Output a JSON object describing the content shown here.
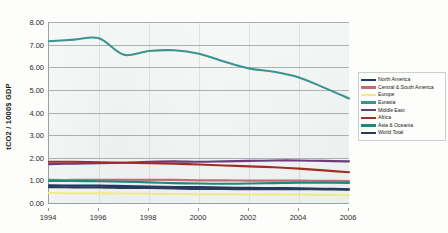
{
  "chart_data": {
    "type": "line",
    "title": "",
    "xlabel": "",
    "ylabel": "tCO2 / 1000$ GDP",
    "xlim": [
      1994,
      2006
    ],
    "ylim": [
      0.0,
      8.0
    ],
    "grid": true,
    "legend_position": "right",
    "y_ticks": [
      "0.00",
      "1.00",
      "2.00",
      "3.00",
      "4.00",
      "5.00",
      "6.00",
      "7.00",
      "8.00"
    ],
    "y_tick_values": [
      0,
      1,
      2,
      3,
      4,
      5,
      6,
      7,
      8
    ],
    "x_ticks": [
      "1994",
      "1996",
      "1998",
      "2000",
      "2002",
      "2004",
      "2006"
    ],
    "x_tick_values": [
      1994,
      1996,
      1998,
      2000,
      2002,
      2004,
      2006
    ],
    "x": [
      1994,
      1995,
      1996,
      1997,
      1998,
      1999,
      2000,
      2001,
      2002,
      2003,
      2004,
      2005,
      2006
    ],
    "series": [
      {
        "name": "North America",
        "color": "#1f3864",
        "values": [
          0.78,
          0.77,
          0.77,
          0.75,
          0.73,
          0.71,
          0.7,
          0.68,
          0.67,
          0.66,
          0.65,
          0.63,
          0.61
        ]
      },
      {
        "name": "Central & South America",
        "color": "#bf6b78",
        "values": [
          1.02,
          1.02,
          1.03,
          1.03,
          1.03,
          1.02,
          1.0,
          1.0,
          0.99,
          0.99,
          0.99,
          0.98,
          0.97
        ]
      },
      {
        "name": "Europe",
        "color": "#f2e98a",
        "values": [
          0.44,
          0.43,
          0.43,
          0.42,
          0.41,
          0.4,
          0.39,
          0.39,
          0.38,
          0.38,
          0.37,
          0.36,
          0.35
        ]
      },
      {
        "name": "Eurasia",
        "color": "#3b9490",
        "values": [
          7.15,
          7.22,
          7.28,
          6.55,
          6.72,
          6.75,
          6.6,
          6.25,
          5.95,
          5.8,
          5.55,
          5.1,
          4.62
        ]
      },
      {
        "name": "Middle East",
        "color": "#6d3a7a",
        "values": [
          1.72,
          1.74,
          1.76,
          1.78,
          1.82,
          1.84,
          1.82,
          1.84,
          1.86,
          1.88,
          1.88,
          1.86,
          1.84
        ]
      },
      {
        "name": "Africa",
        "color": "#a32b22",
        "values": [
          1.82,
          1.82,
          1.8,
          1.78,
          1.76,
          1.74,
          1.7,
          1.66,
          1.62,
          1.58,
          1.52,
          1.44,
          1.36
        ]
      },
      {
        "name": "Asia & Oceania",
        "color": "#1b8a7d",
        "values": [
          0.98,
          0.97,
          0.96,
          0.94,
          0.91,
          0.88,
          0.86,
          0.85,
          0.86,
          0.88,
          0.9,
          0.9,
          0.89
        ]
      },
      {
        "name": "World Total",
        "color": "#2b3a57",
        "values": [
          0.7,
          0.69,
          0.69,
          0.67,
          0.66,
          0.64,
          0.62,
          0.62,
          0.61,
          0.61,
          0.61,
          0.6,
          0.59
        ]
      }
    ]
  }
}
